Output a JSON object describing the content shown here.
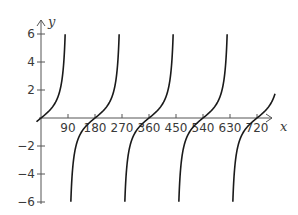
{
  "chart_data": {
    "type": "line",
    "title": "",
    "function": "y = tan(x)",
    "xlabel": "x",
    "ylabel": "y",
    "xlim": [
      0,
      800
    ],
    "ylim": [
      -6,
      6
    ],
    "x_ticks": [
      90,
      180,
      270,
      360,
      450,
      540,
      630,
      720
    ],
    "x_tick_labels": [
      "90",
      "180",
      "270",
      "360",
      "450",
      "540",
      "630",
      "720"
    ],
    "y_ticks": [
      -6,
      -4,
      -2,
      2,
      4,
      6
    ],
    "y_tick_labels": [
      "−6",
      "−4",
      "−2",
      "2",
      "4",
      "6"
    ],
    "vertical_asymptotes": [
      -90,
      90,
      270,
      450,
      630,
      810
    ],
    "zeros": [
      0,
      180,
      360,
      540,
      720
    ],
    "grid": false,
    "legend": null,
    "line_color": "#1a1a1a",
    "axis_color": "#555555"
  }
}
